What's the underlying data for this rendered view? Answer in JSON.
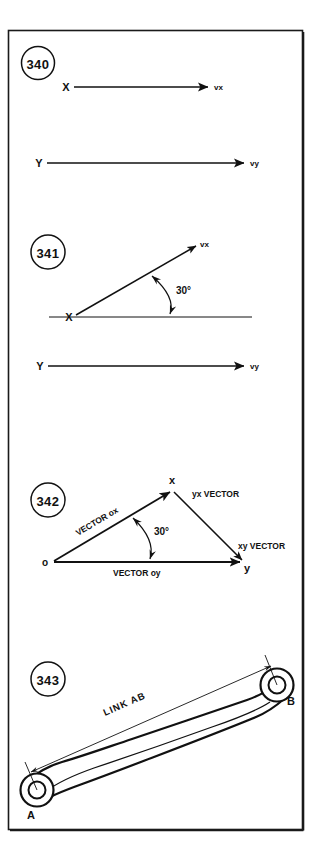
{
  "page": {
    "background_color": "#ffffff",
    "ink_color": "#111111",
    "border_color": "#1a1a1a",
    "width": 322,
    "height": 859
  },
  "figures": [
    {
      "number": "340",
      "caption_labels": {
        "x_tail": "X",
        "x_head": "vx",
        "y_tail": "Y",
        "y_head": "vy"
      }
    },
    {
      "number": "341",
      "caption_labels": {
        "x_tail": "X",
        "x_head": "vx",
        "y_tail": "Y",
        "y_head": "vy",
        "angle": "30°"
      }
    },
    {
      "number": "342",
      "caption_labels": {
        "origin": "o",
        "apex": "x",
        "right": "y",
        "vector_ox": "VECTOR ox",
        "vector_oy": "VECTOR oy",
        "vector_yx": "yx VECTOR",
        "vector_xy": "xy VECTOR",
        "angle": "30°"
      }
    },
    {
      "number": "343",
      "caption_labels": {
        "pin_a": "A",
        "pin_b": "B",
        "dimension": "LINK AB"
      }
    }
  ]
}
